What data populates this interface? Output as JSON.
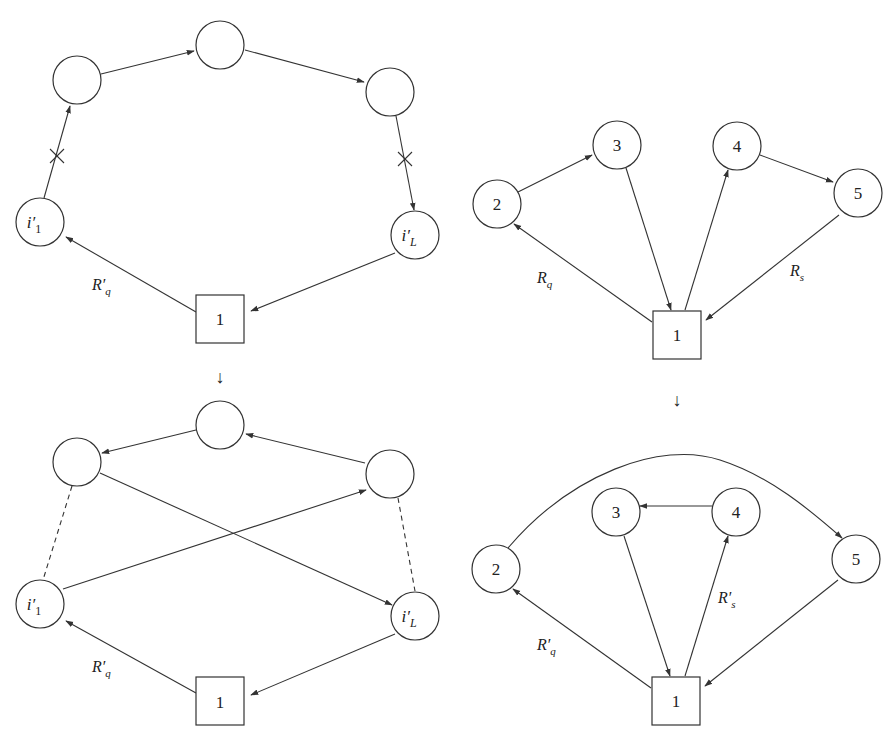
{
  "figure": {
    "panels": [
      {
        "id": "top-left",
        "nodes": [
          {
            "id": "depot",
            "label": "1",
            "shape": "square"
          },
          {
            "id": "i1",
            "label": "i′",
            "sub": "1"
          },
          {
            "id": "a",
            "label": ""
          },
          {
            "id": "b",
            "label": ""
          },
          {
            "id": "c",
            "label": ""
          },
          {
            "id": "iL",
            "label": "i′",
            "sub": "L"
          }
        ],
        "edge_labels": [
          {
            "text": "R′",
            "sub": "q"
          }
        ],
        "removed_edges": [
          "i1->a",
          "c->iL"
        ]
      },
      {
        "id": "bottom-left",
        "nodes": [
          {
            "id": "depot",
            "label": "1",
            "shape": "square"
          },
          {
            "id": "i1",
            "label": "i′",
            "sub": "1"
          },
          {
            "id": "a",
            "label": ""
          },
          {
            "id": "b",
            "label": ""
          },
          {
            "id": "c",
            "label": ""
          },
          {
            "id": "iL",
            "label": "i′",
            "sub": "L"
          }
        ],
        "edge_labels": [
          {
            "text": "R′",
            "sub": "q"
          }
        ]
      },
      {
        "id": "top-right",
        "nodes": [
          {
            "id": "1",
            "label": "1",
            "shape": "square"
          },
          {
            "id": "2",
            "label": "2"
          },
          {
            "id": "3",
            "label": "3"
          },
          {
            "id": "4",
            "label": "4"
          },
          {
            "id": "5",
            "label": "5"
          }
        ],
        "edge_labels": [
          {
            "text": "R",
            "sub": "q"
          },
          {
            "text": "R",
            "sub": "s"
          }
        ]
      },
      {
        "id": "bottom-right",
        "nodes": [
          {
            "id": "1",
            "label": "1",
            "shape": "square"
          },
          {
            "id": "2",
            "label": "2"
          },
          {
            "id": "3",
            "label": "3"
          },
          {
            "id": "4",
            "label": "4"
          },
          {
            "id": "5",
            "label": "5"
          }
        ],
        "edge_labels": [
          {
            "text": "R′",
            "sub": "q"
          },
          {
            "text": "R′",
            "sub": "s"
          }
        ]
      }
    ],
    "transition_arrow": "↓"
  }
}
